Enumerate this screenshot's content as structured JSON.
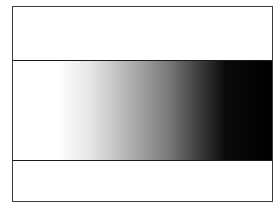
{
  "figure": {
    "frame_color": "#3a3a3a",
    "divider_color": "#1a1a1a",
    "bands": [
      {
        "name": "top",
        "fill": "#ffffff"
      },
      {
        "name": "middle",
        "fill": "gradient"
      },
      {
        "name": "bottom",
        "fill": "#ffffff"
      }
    ],
    "gradient": {
      "direction": "left-to-right",
      "stops": [
        {
          "offset": "0%",
          "color": "#ffffff"
        },
        {
          "offset": "17%",
          "color": "#ffffff"
        },
        {
          "offset": "30%",
          "color": "#e6e6e6"
        },
        {
          "offset": "45%",
          "color": "#b0b0b0"
        },
        {
          "offset": "60%",
          "color": "#7a7a7a"
        },
        {
          "offset": "72%",
          "color": "#3c3c3c"
        },
        {
          "offset": "82%",
          "color": "#0a0a0a"
        },
        {
          "offset": "100%",
          "color": "#000000"
        }
      ]
    }
  }
}
